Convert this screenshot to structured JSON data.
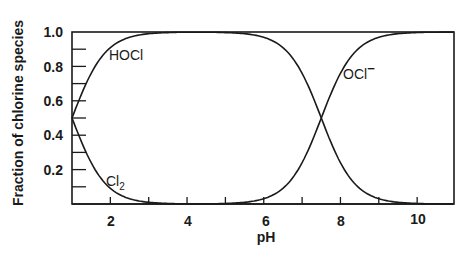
{
  "chart_data": {
    "type": "line",
    "title": "",
    "xlabel": "pH",
    "ylabel": "Fraction of chlorine species",
    "xlim": [
      1,
      11
    ],
    "ylim": [
      0,
      1.0
    ],
    "x_ticks": [
      2,
      4,
      6,
      8,
      10
    ],
    "x_minor_ticks": [
      3,
      5,
      7,
      9
    ],
    "y_ticks": [
      0.2,
      0.4,
      0.6,
      0.8,
      1.0
    ],
    "y_tick_labels": [
      "0.2",
      "0.4",
      "0.6",
      "0.8",
      "1.0"
    ],
    "y_minor_ticks": [
      0.1,
      0.3,
      0.5,
      0.7,
      0.9
    ],
    "grid": false,
    "legend": "none (inline curve labels)",
    "x": [
      1,
      1.5,
      2,
      2.5,
      3,
      3.5,
      4,
      5,
      5.5,
      6,
      6.5,
      7,
      7.25,
      7.5,
      7.75,
      8,
      8.5,
      9,
      9.5,
      10,
      10.5,
      11
    ],
    "series": [
      {
        "name": "Cl2",
        "label": "Cl",
        "subscript": "2",
        "values": [
          0.5,
          0.24,
          0.09,
          0.03,
          0.01,
          0.0,
          0.0,
          0.0,
          0.0,
          0.0,
          0.0,
          0.0,
          0.0,
          0.0,
          0.0,
          0.0,
          0.0,
          0.0,
          0.0,
          0.0,
          0.0,
          0.0
        ]
      },
      {
        "name": "HOCl",
        "label": "HOCl",
        "subscript": "",
        "values": [
          0.5,
          0.76,
          0.91,
          0.97,
          0.99,
          1.0,
          1.0,
          1.0,
          0.99,
          0.97,
          0.91,
          0.76,
          0.64,
          0.5,
          0.36,
          0.24,
          0.09,
          0.03,
          0.01,
          0.0,
          0.0,
          0.0
        ]
      },
      {
        "name": "OCl-",
        "label": "OCl",
        "superscript": "−",
        "values": [
          0.0,
          0.0,
          0.0,
          0.0,
          0.0,
          0.0,
          0.0,
          0.0,
          0.01,
          0.03,
          0.09,
          0.24,
          0.36,
          0.5,
          0.64,
          0.76,
          0.91,
          0.97,
          0.99,
          1.0,
          1.0,
          1.0
        ]
      }
    ],
    "annotations": [
      {
        "text": "HOCl",
        "near_x": 2.0,
        "near_y": 0.87
      },
      {
        "text": "Cl2",
        "near_x": 2.0,
        "near_y": 0.12
      },
      {
        "text": "OCl−",
        "near_x": 8.0,
        "near_y": 0.82
      }
    ],
    "colors": {
      "line": "#1a1a1a",
      "background": "#ffffff"
    }
  },
  "labels": {
    "ylabel": "Fraction of chlorine species",
    "xlabel": "pH",
    "hocl": "HOCl",
    "cl2_base": "Cl",
    "cl2_sub": "2",
    "ocl_base": "OCl",
    "ocl_sup": "−",
    "xt2": "2",
    "xt4": "4",
    "xt6": "6",
    "xt8": "8",
    "xt10": "10",
    "yt02": "0.2",
    "yt04": "0.4",
    "yt06": "0.6",
    "yt08": "0.8",
    "yt10": "1.0"
  }
}
